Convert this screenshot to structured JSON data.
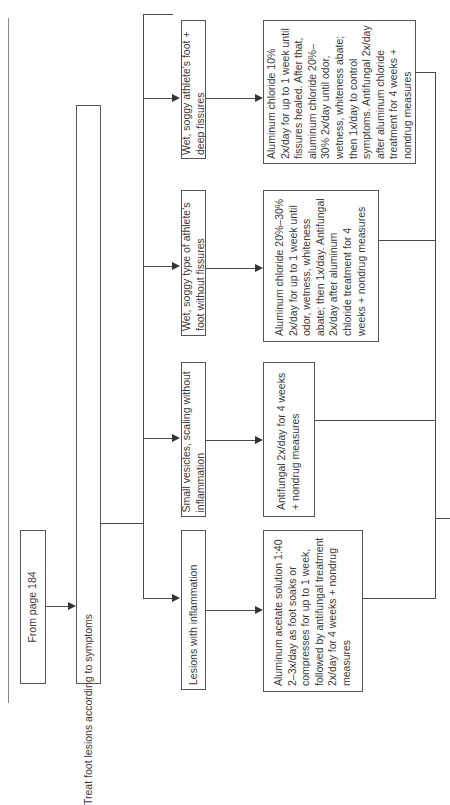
{
  "flowchart": {
    "orientation": "rotated-90-ccw",
    "start": {
      "label": "From page 184"
    },
    "root": {
      "label": "Treat foot lesions according to symptoms"
    },
    "branches": [
      {
        "condition": "Lesions with inflammation",
        "treatment": "Aluminum acetate solution 1:40 2–3x/day as foot soaks or compresses for up to 1 week, followed by antifungal treatment 2x/day for 4 weeks + nondrug measures"
      },
      {
        "condition": "Small vesicles, scaling without inflammation",
        "treatment": "Antifungal 2x/day for 4 weeks + nondrug measures"
      },
      {
        "condition": "Wet, soggy type of athlete's foot without fissures",
        "treatment": "Aluminum chloride 20%–30% 2x/day for up to 1 week until odor, wetness, whiteness abate; then 1x/day. Antifungal 2x/day after aluminum chloride treatment for 4 weeks + nondrug measures"
      },
      {
        "condition": "Wet, soggy athlete's foot + deep fissures",
        "treatment": "Aluminum chloride 10% 2x/day for up to 1 week until fissures healed. After that, aluminum chloride 20%–30% 2x/day until odor, wetness, whiteness abate; then 1x/day to control symptoms. Antifungal 2x/day after aluminum chloride treatment for 4 weeks + nondrug measures"
      }
    ],
    "colors": {
      "line": "#4a4a4a",
      "box_border": "#555555",
      "text": "#3a3a3a",
      "background": "#ffffff"
    }
  }
}
